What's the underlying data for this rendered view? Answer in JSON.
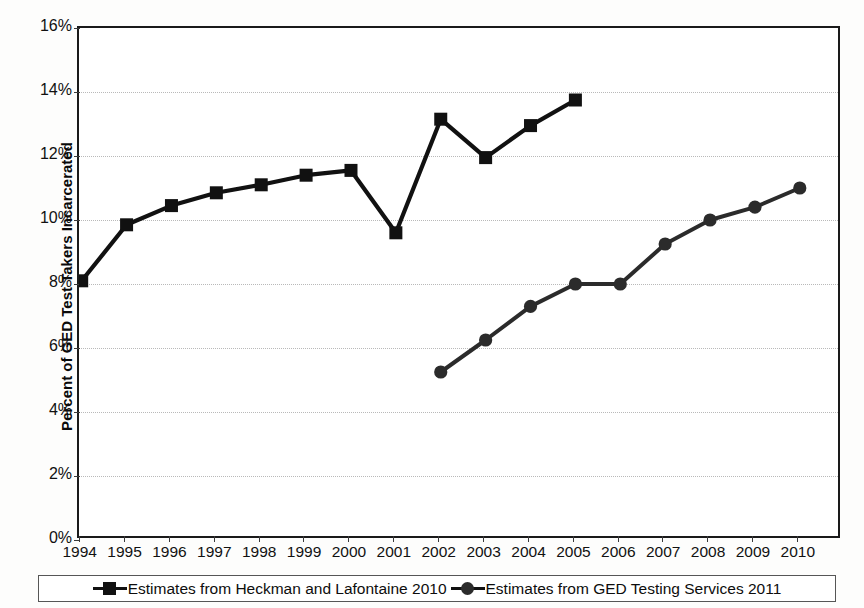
{
  "chart_data": {
    "type": "line",
    "title": "",
    "xlabel": "",
    "ylabel": "Percent of GED Test Takers Incarcerated",
    "x": [
      1994,
      1995,
      1996,
      1997,
      1998,
      1999,
      2000,
      2001,
      2002,
      2003,
      2004,
      2005,
      2006,
      2007,
      2008,
      2009,
      2010
    ],
    "categories": [
      "1994",
      "1995",
      "1996",
      "1997",
      "1998",
      "1999",
      "2000",
      "2001",
      "2002",
      "2003",
      "2004",
      "2005",
      "2006",
      "2007",
      "2008",
      "2009",
      "2010"
    ],
    "ylim": [
      0,
      16
    ],
    "yticks": [
      0,
      2,
      4,
      6,
      8,
      10,
      12,
      14,
      16
    ],
    "ytick_labels": [
      "0%",
      "2%",
      "4%",
      "6%",
      "8%",
      "10%",
      "12%",
      "14%",
      "16%"
    ],
    "grid": true,
    "legend_position": "bottom",
    "series": [
      {
        "name": "Estimates from Heckman and Lafontaine 2010",
        "marker": "square",
        "color": "#111111",
        "values": [
          8.1,
          9.85,
          10.45,
          10.85,
          11.1,
          11.4,
          11.55,
          9.6,
          13.15,
          11.95,
          12.95,
          13.75,
          null,
          null,
          null,
          null,
          null
        ]
      },
      {
        "name": "Estimates from GED Testing Services 2011",
        "marker": "circle",
        "color": "#2b2b2b",
        "values": [
          null,
          null,
          null,
          null,
          null,
          null,
          null,
          null,
          5.25,
          6.25,
          7.3,
          8.0,
          8.0,
          9.25,
          10.0,
          10.4,
          11.0
        ]
      }
    ]
  },
  "axis": {
    "y_title": "Percent of GED Test Takers Incarcerated"
  },
  "legend": {
    "entries": [
      {
        "label": "Estimates from Heckman and Lafontaine 2010",
        "marker": "square"
      },
      {
        "label": "Estimates from GED Testing Services 2011",
        "marker": "circle"
      }
    ]
  }
}
